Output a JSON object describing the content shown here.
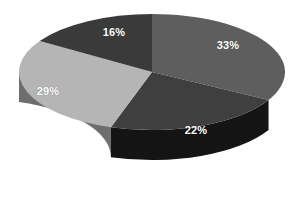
{
  "chart_data": {
    "type": "pie",
    "title": "",
    "subtitle": "",
    "xlabel": "",
    "ylabel": "",
    "grid": false,
    "legend": "none",
    "three_d": true,
    "background": "#ffffff",
    "categories": [
      "Segment 1",
      "Segment 2",
      "Segment 3",
      "Segment 4"
    ],
    "values": [
      33,
      22,
      29,
      16
    ],
    "labels": [
      "33%",
      "22%",
      "29%",
      "16%"
    ],
    "label_color": "#ffffff",
    "total": 100,
    "units": "percent",
    "slices": [
      {
        "label": "33%",
        "value": 33,
        "top_color": "#5e5e5e",
        "side_color": "#1b1b1b",
        "start_angle": 0,
        "end_angle": 118.8,
        "label_x": 228,
        "label_y": 45
      },
      {
        "label": "22%",
        "value": 22,
        "top_color": "#3f3f3f",
        "side_color": "#141414",
        "start_angle": 118.8,
        "end_angle": 198.0,
        "label_x": 196,
        "label_y": 130
      },
      {
        "label": "29%",
        "value": 29,
        "top_color": "#b5b5b5",
        "side_color": "#6e6e6e",
        "start_angle": 198.0,
        "end_angle": 302.4,
        "label_x": 48,
        "label_y": 91
      },
      {
        "label": "16%",
        "value": 16,
        "top_color": "#3a3a3a",
        "side_color": "#2a2a2a",
        "start_angle": 302.4,
        "end_angle": 360,
        "label_x": 114,
        "label_y": 32
      }
    ],
    "geometry": {
      "center_x": 152,
      "center_y": 72,
      "radius_x": 133,
      "radius_y": 58,
      "depth": 30
    }
  }
}
